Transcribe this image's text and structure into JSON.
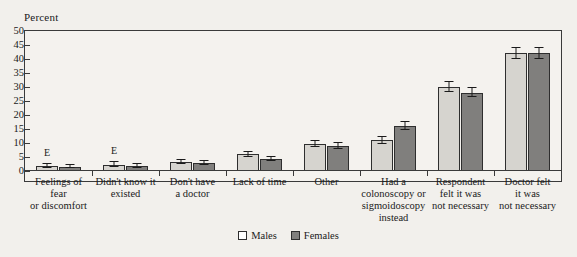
{
  "chart_data": {
    "type": "bar",
    "title": "",
    "ylabel": "Percent",
    "xlabel": "",
    "ylim": [
      0,
      50
    ],
    "yticks": [
      0,
      5,
      10,
      15,
      20,
      25,
      30,
      35,
      40,
      45,
      50
    ],
    "grid": false,
    "legend_position": "bottom",
    "categories": [
      "Feelings of fear or discomfort",
      "Didn't know it existed",
      "Don't have a doctor",
      "Lack of time",
      "Other",
      "Had a colonoscopy or sigmoidoscopy instead",
      "Respondent felt it was not necessary",
      "Doctor felt it was not necessary"
    ],
    "category_lines": [
      [
        "Feelings of",
        "fear",
        "or discomfort"
      ],
      [
        "Didn't know it",
        "existed"
      ],
      [
        "Don't have",
        "a doctor"
      ],
      [
        "Lack of time"
      ],
      [
        "Other"
      ],
      [
        "Had a",
        "colonoscopy or",
        "sigmoidoscopy",
        "instead"
      ],
      [
        "Respondent",
        "felt it was",
        "not necessary"
      ],
      [
        "Doctor felt",
        "it was",
        "not necessary"
      ]
    ],
    "series": [
      {
        "name": "Males",
        "color": "#d6d4cf",
        "values": [
          1.8,
          2.3,
          3.2,
          6.0,
          9.5,
          11.0,
          30.0,
          42.0
        ],
        "errors": [
          0.7,
          0.8,
          0.8,
          0.9,
          1.1,
          1.3,
          1.8,
          2.0
        ],
        "flags": [
          "E",
          "E",
          "",
          "",
          "",
          "",
          "",
          ""
        ]
      },
      {
        "name": "Females",
        "color": "#807f7d",
        "values": [
          1.5,
          1.9,
          3.0,
          4.3,
          9.0,
          16.0,
          28.0,
          42.0
        ],
        "errors": [
          0.6,
          0.7,
          0.7,
          0.8,
          1.0,
          1.5,
          1.7,
          2.0
        ],
        "flags": [
          "",
          "",
          "",
          "",
          "",
          "",
          "",
          ""
        ]
      }
    ]
  },
  "legend": {
    "items": [
      {
        "label": "Males",
        "swatch": "male"
      },
      {
        "label": "Females",
        "swatch": "female"
      }
    ]
  },
  "axis": {
    "y_title": "Percent"
  },
  "colors": {
    "male_bar": "#d6d4cf",
    "female_bar": "#807f7d",
    "axis": "#3a3a3a",
    "background": "#f2f0ec"
  }
}
